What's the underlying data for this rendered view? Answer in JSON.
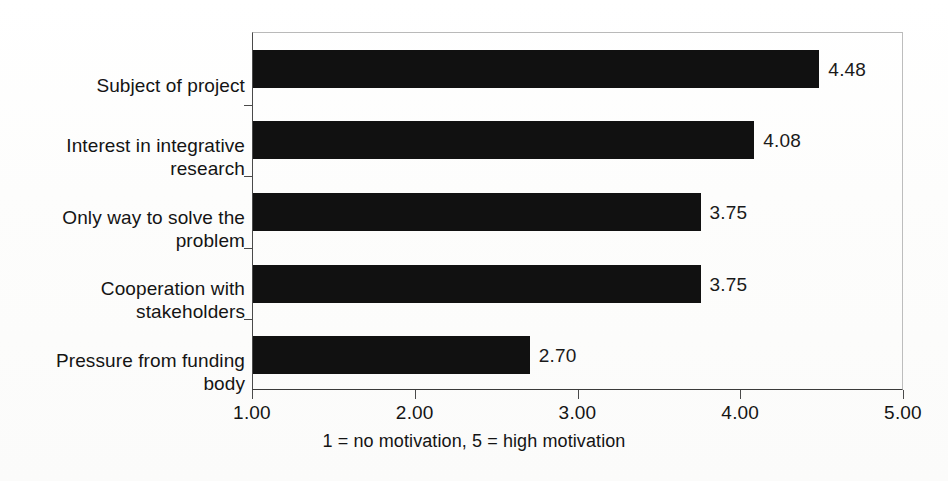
{
  "chart_data": {
    "type": "bar",
    "orientation": "horizontal",
    "title": "",
    "subtitle": "",
    "xlabel": "1 =  no motivation, 5 = high motivation",
    "ylabel": "",
    "categories": [
      "Subject of project",
      "Interest in integrative research",
      "Only way to solve the problem",
      "Cooperation with stakeholders",
      "Pressure from funding body"
    ],
    "category_lines": [
      [
        "Subject of project"
      ],
      [
        "Interest in integrative",
        "research"
      ],
      [
        "Only way to solve the",
        "problem"
      ],
      [
        "Cooperation with",
        "stakeholders"
      ],
      [
        "Pressure from funding",
        "body"
      ]
    ],
    "values": [
      4.48,
      4.08,
      3.75,
      3.75,
      2.7
    ],
    "value_labels": [
      "4.48",
      "4.08",
      "3.75",
      "3.75",
      "2.70"
    ],
    "xlim": [
      1.0,
      5.0
    ],
    "xticks": [
      1.0,
      2.0,
      3.0,
      4.0,
      5.0
    ],
    "xtick_labels": [
      "1.00",
      "2.00",
      "3.00",
      "4.00",
      "5.00"
    ],
    "grid": false,
    "legend": null,
    "bar_color": "#111111",
    "axis_color": "#3a3a3a",
    "frame_color": "#bdbdbd",
    "background_color": "#fefefe"
  }
}
